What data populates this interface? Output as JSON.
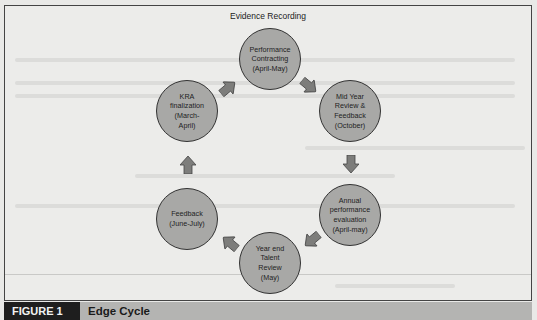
{
  "diagram": {
    "top_label": "Evidence Recording",
    "nodes": [
      {
        "id": "performance-contracting",
        "label": "Performance Contracting (April-May)",
        "lines": [
          "Performance",
          "Contracting",
          "(April-May)"
        ]
      },
      {
        "id": "mid-year-review",
        "label": "Mid Year Review & Feedback (October)",
        "lines": [
          "Mid Year",
          "Review &",
          "Feedback",
          "(October)"
        ]
      },
      {
        "id": "annual-evaluation",
        "label": "Annual performance evaluation (April-may)",
        "lines": [
          "Annual",
          "performance",
          "evaluation",
          "(April-may)"
        ]
      },
      {
        "id": "year-end-talent-review",
        "label": "Year end Talent Review (May)",
        "lines": [
          "Year end",
          "Talent",
          "Review",
          "(May)"
        ]
      },
      {
        "id": "feedback",
        "label": "Feedback (June-July)",
        "lines": [
          "Feedback",
          "(June-July)"
        ]
      },
      {
        "id": "kra-finalization",
        "label": "KRA finalization (March-April)",
        "lines": [
          "KRA",
          "finalization",
          "(March-",
          "April)"
        ]
      }
    ],
    "edges": [
      [
        "performance-contracting",
        "mid-year-review"
      ],
      [
        "mid-year-review",
        "annual-evaluation"
      ],
      [
        "annual-evaluation",
        "year-end-talent-review"
      ],
      [
        "year-end-talent-review",
        "feedback"
      ],
      [
        "feedback",
        "kra-finalization"
      ],
      [
        "kra-finalization",
        "performance-contracting"
      ]
    ],
    "colors": {
      "node_fill": "#a8a8a6",
      "node_border": "#333333",
      "arrow_fill": "#7d7d7b",
      "caption_bar": "#b4b4b2",
      "figure_tag": "#1e1e1e"
    }
  },
  "caption": {
    "figure_label": "FIGURE 1",
    "title": "Edge Cycle"
  }
}
